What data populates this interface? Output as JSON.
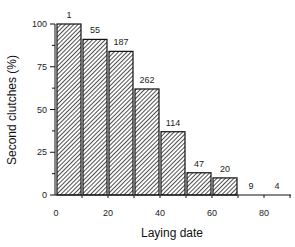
{
  "chart_data": {
    "type": "bar",
    "title": "",
    "xlabel": "Laying date",
    "ylabel": "Second clutches (%)",
    "xlim": [
      0,
      90
    ],
    "ylim": [
      0,
      100
    ],
    "xticks": [
      0,
      20,
      40,
      60,
      80
    ],
    "yticks": [
      0,
      25,
      50,
      75,
      100
    ],
    "grid": false,
    "legend": null,
    "bin_width": 10,
    "bins": [
      {
        "start": 0,
        "end": 10,
        "value": 100,
        "label": "1"
      },
      {
        "start": 10,
        "end": 20,
        "value": 91,
        "label": "55"
      },
      {
        "start": 20,
        "end": 30,
        "value": 84,
        "label": "187"
      },
      {
        "start": 30,
        "end": 40,
        "value": 62,
        "label": "262"
      },
      {
        "start": 40,
        "end": 50,
        "value": 37,
        "label": "114"
      },
      {
        "start": 50,
        "end": 60,
        "value": 13,
        "label": "47"
      },
      {
        "start": 60,
        "end": 70,
        "value": 10,
        "label": "20"
      },
      {
        "start": 70,
        "end": 80,
        "value": 0,
        "label": "9"
      },
      {
        "start": 80,
        "end": 90,
        "value": 0,
        "label": "4"
      }
    ],
    "categories": [
      "0-10",
      "10-20",
      "20-30",
      "30-40",
      "40-50",
      "50-60",
      "60-70",
      "70-80",
      "80-90"
    ],
    "values": [
      100,
      91,
      84,
      62,
      37,
      13,
      10,
      0,
      0
    ],
    "annotations": [
      "1",
      "55",
      "187",
      "262",
      "114",
      "47",
      "20",
      "9",
      "4"
    ],
    "bar_fill": "hatched diagonal",
    "colors": {
      "bar_stroke": "#111111",
      "hatch": "#222222",
      "background": "#ffffff"
    }
  }
}
